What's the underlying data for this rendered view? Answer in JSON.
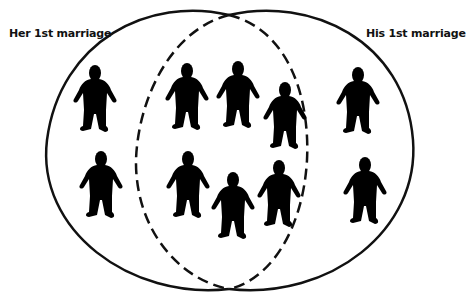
{
  "diagram": {
    "type": "venn",
    "labels": {
      "left": "Her 1st marriage",
      "right": "His 1st marriage"
    },
    "sets": [
      {
        "name": "Her 1st marriage",
        "line": "solid-outer / dashed-inner",
        "only_count": 2
      },
      {
        "name": "His 1st marriage",
        "line": "solid-outer / dashed-inner",
        "only_count": 2
      }
    ],
    "overlap_count": 6,
    "total_people": 10,
    "colors": {
      "stroke": "#111111",
      "figure": "#000000",
      "background": "#ffffff"
    },
    "figures": [
      {
        "region": "her-only",
        "x": 95,
        "y": 66
      },
      {
        "region": "overlap",
        "x": 187,
        "y": 64
      },
      {
        "region": "overlap",
        "x": 238,
        "y": 62
      },
      {
        "region": "overlap",
        "x": 285,
        "y": 83
      },
      {
        "region": "his-only",
        "x": 358,
        "y": 68
      },
      {
        "region": "her-only",
        "x": 101,
        "y": 152
      },
      {
        "region": "overlap",
        "x": 188,
        "y": 152
      },
      {
        "region": "overlap",
        "x": 233,
        "y": 173
      },
      {
        "region": "overlap",
        "x": 279,
        "y": 161
      },
      {
        "region": "his-only",
        "x": 365,
        "y": 158
      }
    ]
  }
}
